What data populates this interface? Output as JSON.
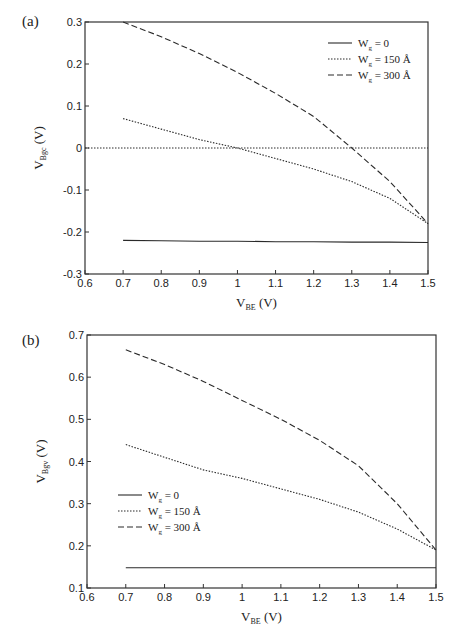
{
  "chart_data": [
    {
      "panel": "(a)",
      "type": "line",
      "title": "",
      "xlabel": "V_BE (V)",
      "ylabel": "V_Bgc (V)",
      "xlim": [
        0.6,
        1.5
      ],
      "ylim": [
        -0.3,
        0.3
      ],
      "xticks": [
        "0.6",
        "0.7",
        "0.8",
        "0.9",
        "1",
        "1.1",
        "1.2",
        "1.3",
        "1.4",
        "1.5"
      ],
      "yticks": [
        "-0.3",
        "-0.2",
        "-0.1",
        "0",
        "0.1",
        "0.2",
        "0.3"
      ],
      "grid": false,
      "legend_position": "upper right",
      "reference_line": {
        "y": 0,
        "style": "dotted"
      },
      "x": [
        0.7,
        0.8,
        0.9,
        1.0,
        1.1,
        1.2,
        1.3,
        1.4,
        1.5
      ],
      "series": [
        {
          "name": "W_g = 0",
          "style": "solid",
          "values": [
            -0.22,
            -0.221,
            -0.222,
            -0.222,
            -0.223,
            -0.223,
            -0.224,
            -0.224,
            -0.225
          ]
        },
        {
          "name": "W_g = 150 Å",
          "style": "dotted",
          "values": [
            0.07,
            0.045,
            0.02,
            0.0,
            -0.025,
            -0.05,
            -0.08,
            -0.12,
            -0.18
          ]
        },
        {
          "name": "W_g = 300 Å",
          "style": "dashed",
          "values": [
            0.3,
            0.265,
            0.225,
            0.18,
            0.13,
            0.075,
            0.0,
            -0.08,
            -0.18
          ]
        }
      ]
    },
    {
      "panel": "(b)",
      "type": "line",
      "title": "",
      "xlabel": "V_BE (V)",
      "ylabel": "V_Bgv (V)",
      "xlim": [
        0.6,
        1.5
      ],
      "ylim": [
        0.1,
        0.7
      ],
      "xticks": [
        "0.6",
        "0.7",
        "0.8",
        "0.9",
        "1",
        "1.1",
        "1.2",
        "1.3",
        "1.4",
        "1.5"
      ],
      "yticks": [
        "0.1",
        "0.2",
        "0.3",
        "0.4",
        "0.5",
        "0.6",
        "0.7"
      ],
      "grid": false,
      "legend_position": "center left",
      "x": [
        0.7,
        0.8,
        0.9,
        1.0,
        1.1,
        1.2,
        1.3,
        1.4,
        1.5
      ],
      "series": [
        {
          "name": "W_g = 0",
          "style": "solid",
          "values": [
            0.148,
            0.148,
            0.148,
            0.148,
            0.148,
            0.148,
            0.148,
            0.148,
            0.148
          ]
        },
        {
          "name": "W_g = 150 Å",
          "style": "dotted",
          "values": [
            0.44,
            0.41,
            0.38,
            0.36,
            0.335,
            0.31,
            0.28,
            0.24,
            0.19
          ]
        },
        {
          "name": "W_g = 300 Å",
          "style": "dashed",
          "values": [
            0.665,
            0.63,
            0.59,
            0.545,
            0.5,
            0.45,
            0.39,
            0.3,
            0.19
          ]
        }
      ]
    }
  ],
  "panels": {
    "a": {
      "label": "(a)",
      "xlabel_main": "V",
      "xlabel_sub": "BE",
      "xlabel_unit": " (V)",
      "ylabel_main": "V",
      "ylabel_sub": "Bgc",
      "ylabel_unit": " (V)"
    },
    "b": {
      "label": "(b)",
      "xlabel_main": "V",
      "xlabel_sub": "BE",
      "xlabel_unit": " (V)",
      "ylabel_main": "V",
      "ylabel_sub": "Bgv",
      "ylabel_unit": " (V)"
    }
  },
  "legend": [
    {
      "main": "W",
      "sub": "g",
      "rest": " = 0"
    },
    {
      "main": "W",
      "sub": "g",
      "rest": " = 150 Å"
    },
    {
      "main": "W",
      "sub": "g",
      "rest": " = 300 Å"
    }
  ],
  "colors": {
    "line": "#2a2a2a",
    "axis": "#333333"
  }
}
